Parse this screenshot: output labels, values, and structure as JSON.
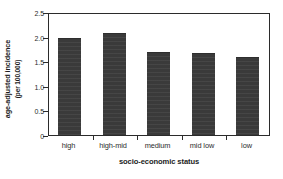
{
  "chart_data": {
    "type": "bar",
    "title": "",
    "xlabel": "socio-economic status",
    "ylabel_line1": "age-adjusted incidence",
    "ylabel_line2": "(per 100,000)",
    "categories": [
      "high",
      "high-mid",
      "medium",
      "mid low",
      "low"
    ],
    "values": [
      1.97,
      2.07,
      1.68,
      1.66,
      1.59
    ],
    "ylim": [
      0,
      2.5
    ],
    "ytick_labels": [
      "2.5",
      "2.0",
      "1.5",
      "1.0",
      "0.5",
      "0"
    ],
    "ytick_values": [
      2.5,
      2.0,
      1.5,
      1.0,
      0.5,
      0
    ],
    "grid": "off",
    "legend": "none",
    "bar_color": "#3a3a3a",
    "axis_color": "#2b2b2b",
    "background_color": "#ffffff"
  }
}
